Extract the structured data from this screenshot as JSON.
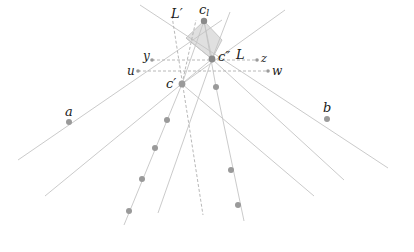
{
  "diagram": {
    "width": 414,
    "height": 252,
    "colors": {
      "line": "#bdbdbd",
      "dashed": "#b0b0b0",
      "point": "#9a9a9a",
      "center_point": "#8a8a8a",
      "region_fill": "#d8d8d8",
      "label": "#1a1a1a"
    },
    "labels": {
      "c_l": "c",
      "c_l_sub": "l",
      "c_double_prime": "c″",
      "c_prime": "c′",
      "L": "L",
      "L_prime": "L′",
      "y": "y",
      "z": "z",
      "u": "u",
      "w": "w",
      "a": "a",
      "b": "b"
    },
    "points": {
      "c_l": [
        204,
        21
      ],
      "c_double_prime": [
        212,
        59
      ],
      "c_prime": [
        182,
        84
      ],
      "y": [
        152,
        60
      ],
      "z": [
        257,
        60
      ],
      "u": [
        138,
        71
      ],
      "w": [
        268,
        71
      ],
      "a": [
        69,
        122
      ],
      "b": [
        327,
        119
      ],
      "left_chain": [
        [
          182,
          84
        ],
        [
          167,
          120
        ],
        [
          155,
          148
        ],
        [
          142,
          179
        ],
        [
          129,
          211
        ]
      ],
      "right_chain": [
        [
          216,
          87
        ],
        [
          231,
          170
        ],
        [
          238,
          205
        ]
      ]
    },
    "shaded_region": [
      [
        204,
        21
      ],
      [
        186,
        38
      ],
      [
        212,
        59
      ],
      [
        222,
        40
      ]
    ]
  }
}
